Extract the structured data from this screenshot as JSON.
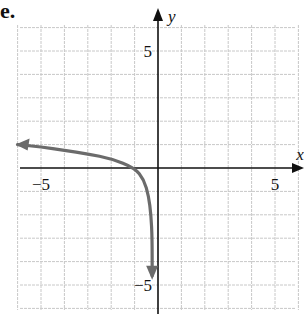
{
  "part_label": "e.",
  "chart_data": {
    "type": "line",
    "title": "",
    "xlabel": "x",
    "ylabel": "y",
    "xlim": [
      -6,
      6
    ],
    "ylim": [
      -6,
      6
    ],
    "grid": true,
    "x_tick_labels": [
      {
        "value": -5,
        "label": "−5"
      },
      {
        "value": 5,
        "label": "5"
      }
    ],
    "y_tick_labels": [
      {
        "value": 5,
        "label": "5"
      },
      {
        "value": -5,
        "label": "−5"
      }
    ],
    "series": [
      {
        "name": "curve",
        "color": "#6b6b6b",
        "arrows": [
          "start",
          "end"
        ],
        "x": [
          -6,
          -5,
          -4,
          -3,
          -2,
          -1,
          -0.6,
          -0.4,
          -0.3,
          -0.25,
          -0.25
        ],
        "y": [
          1.0,
          0.9,
          0.75,
          0.6,
          0.4,
          0,
          -0.5,
          -1.2,
          -2.0,
          -3.0,
          -4.6
        ]
      }
    ]
  },
  "colors": {
    "grid": "#c8c8c8",
    "axis": "#111111",
    "curve": "#6b6b6b"
  }
}
